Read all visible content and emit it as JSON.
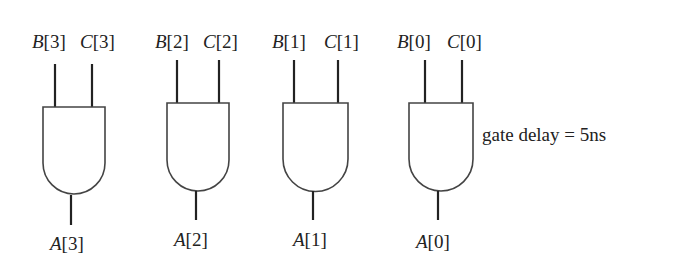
{
  "diagram": {
    "type": "logic-circuit",
    "gate_type": "AND",
    "annotation": "gate delay = 5ns",
    "gates": [
      {
        "id": "gate-3",
        "input_a": "B",
        "input_b": "C",
        "index": "3",
        "in_a_label": "B",
        "in_b_label": "C",
        "output_label": "A",
        "idx_text": "[3]"
      },
      {
        "id": "gate-2",
        "input_a": "B",
        "input_b": "C",
        "index": "2",
        "in_a_label": "B",
        "in_b_label": "C",
        "output_label": "A",
        "idx_text": "[2]"
      },
      {
        "id": "gate-1",
        "input_a": "B",
        "input_b": "C",
        "index": "1",
        "in_a_label": "B",
        "in_b_label": "C",
        "output_label": "A",
        "idx_text": "[1]"
      },
      {
        "id": "gate-0",
        "input_a": "B",
        "input_b": "C",
        "index": "0",
        "in_a_label": "B",
        "in_b_label": "C",
        "output_label": "A",
        "idx_text": "[0]"
      }
    ]
  }
}
